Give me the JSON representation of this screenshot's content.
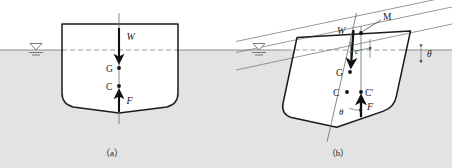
{
  "figure": {
    "kind": "ship-stability-diagram",
    "captions": {
      "a": "（a）",
      "b": "（b）"
    }
  },
  "colors": {
    "water_fill": "#e3e3e3",
    "hull_line": "#1a1a1a",
    "thin_line": "#6b6b6b",
    "arrow": "#111111",
    "waterline_dash": "#8c8c8c",
    "background": "#ffffff"
  },
  "panel_a": {
    "name": "upright-ship",
    "labels": {
      "weight": "W",
      "center_of_gravity": "G",
      "center_of_buoyancy": "C",
      "buoyant_force": "F"
    },
    "water_surface_symbol": "water-level-triangle",
    "waterline_style": "dashed-inside-hull",
    "description_hidden": ""
  },
  "panel_b": {
    "name": "heeled-ship",
    "labels": {
      "metacenter": "M",
      "weight": "W",
      "center_of_gravity": "G",
      "center_of_buoyancy": "C",
      "center_of_buoyancy_shifted": "C'",
      "buoyant_force": "F",
      "righting_arm": "e",
      "heel_angle_hull": "θ",
      "heel_angle_waterline": "θ"
    },
    "heel_angle_degrees": 12,
    "water_surface_symbol": "water-level-triangle",
    "waterline_style": "dashed-inside-hull"
  }
}
